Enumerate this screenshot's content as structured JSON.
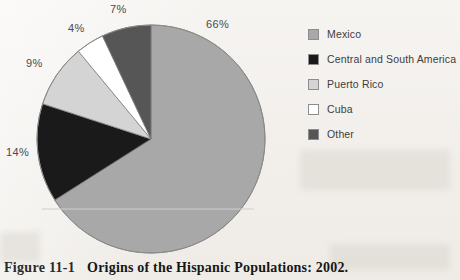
{
  "figure": {
    "number": "Figure 11-1",
    "title": "Origins of the Hispanic Populations: 2002."
  },
  "legend": {
    "items": [
      {
        "label": "Mexico",
        "color": "#a8a8a8"
      },
      {
        "label": "Central and South America",
        "color": "#1a1a1a"
      },
      {
        "label": "Puerto Rico",
        "color": "#d4d4d4"
      },
      {
        "label": "Cuba",
        "color": "#ffffff"
      },
      {
        "label": "Other",
        "color": "#565656"
      }
    ]
  },
  "labels": {
    "mexico": "66%",
    "central": "14%",
    "puerto": "9%",
    "cuba": "4%",
    "other": "7%"
  },
  "chart_data": {
    "type": "pie",
    "title": "Origins of the Hispanic Populations: 2002.",
    "categories": [
      "Mexico",
      "Central and South America",
      "Puerto Rico",
      "Cuba",
      "Other"
    ],
    "values": [
      66,
      14,
      9,
      4,
      7
    ],
    "value_labels": [
      "66%",
      "14%",
      "9%",
      "4%",
      "7%"
    ],
    "unit": "percent",
    "colors": [
      "#a8a8a8",
      "#1a1a1a",
      "#d4d4d4",
      "#ffffff",
      "#565656"
    ],
    "start_angle_deg": 0,
    "direction": "clockwise",
    "legend_position": "right",
    "grid": false,
    "xlabel": "",
    "ylabel": ""
  }
}
